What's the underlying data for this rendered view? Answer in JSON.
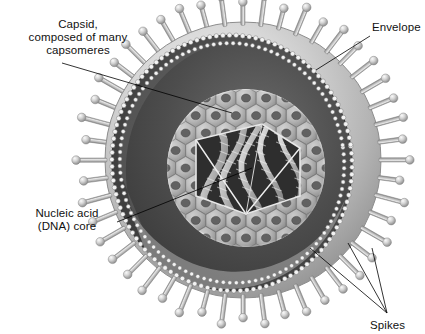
{
  "figure": {
    "kind": "scientific-illustration",
    "style": "grayscale pencil/airbrush rendering",
    "background_color": "#ffffff",
    "width": 425,
    "height": 334
  },
  "labels": {
    "capsid": {
      "line1": "Capsid,",
      "line2": "composed of many",
      "line3": "capsomeres",
      "x": 13,
      "y": 18,
      "align": "center"
    },
    "envelope": {
      "text": "Envelope",
      "x": 372,
      "y": 21,
      "align": "left"
    },
    "nucleic_acid": {
      "line1": "Nucleic acid",
      "line2": "(DNA) core",
      "x": 18,
      "y": 207,
      "align": "center"
    },
    "spikes": {
      "text": "Spikes",
      "x": 370,
      "y": 319,
      "align": "left"
    }
  },
  "leaders": [
    {
      "name": "capsid-leader",
      "from": [
        62,
        63
      ],
      "to": [
        232,
        113
      ]
    },
    {
      "name": "envelope-leader",
      "from": [
        370,
        36
      ],
      "to": [
        316,
        70
      ]
    },
    {
      "name": "nucleic-acid-leader",
      "from": [
        117,
        222
      ],
      "to": [
        252,
        168
      ]
    },
    {
      "name": "spikes-leader-1",
      "from": [
        387,
        313
      ],
      "to": [
        310,
        248
      ]
    },
    {
      "name": "spikes-leader-2",
      "from": [
        387,
        313
      ],
      "to": [
        348,
        243
      ]
    },
    {
      "name": "spikes-leader-3",
      "from": [
        387,
        313
      ],
      "to": [
        372,
        248
      ]
    }
  ],
  "structures": {
    "envelope": {
      "name": "envelope",
      "description": "outer lipid membrane sphere, light gray, cut away on the upper-left",
      "center": [
        243,
        160
      ],
      "radius": 138,
      "surface_color": "#c9c9c9",
      "highlight_color": "#eaeaea",
      "shadow_color": "#8a8a8a"
    },
    "membrane_rim": {
      "name": "membrane-bilayer-rim",
      "description": "beaded double-layer cut edge of the envelope",
      "bead_color": "#f2f2f2",
      "bead_outline": "#6f6f6f"
    },
    "inner_cavity": {
      "name": "tegument-cavity",
      "description": "dark interior space between envelope and capsid",
      "color": "#4a4a4a"
    },
    "capsid": {
      "name": "capsid",
      "description": "icosahedral shell built from hexagonal ring-shaped capsomeres",
      "center": [
        246,
        168
      ],
      "radius": 78,
      "capsomere_shape": "hexagonal ring",
      "capsomere_color": "#d2d2d2",
      "capsomere_hole_color": "#6e6e6e"
    },
    "core": {
      "name": "nucleic-acid-core",
      "description": "twisted DNA strands inside the opened capsid window",
      "cavity_color": "#2e2e2e",
      "strand_color": "#e0e0e0"
    },
    "spikes": {
      "name": "glycoprotein-spikes",
      "description": "rod-shaped projections with rounded knob tips radiating from envelope",
      "count": 48,
      "rod_color": "#bdbdbd",
      "knob_color": "#d8d8d8"
    }
  }
}
